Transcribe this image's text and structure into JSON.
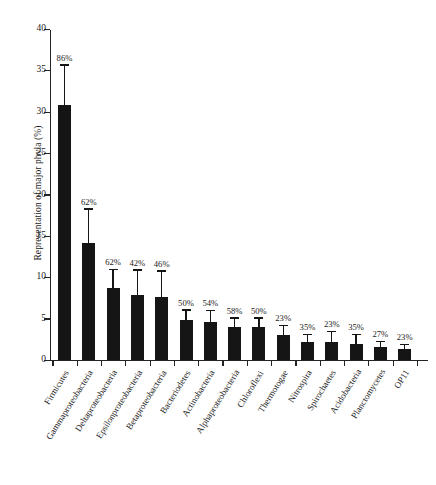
{
  "chart_data": {
    "type": "bar",
    "title": "",
    "xlabel": "",
    "ylabel": "Representation of major phyla (%)",
    "ylim": [
      0,
      40
    ],
    "ytick_labels": [
      "0",
      "5",
      "10",
      "15",
      "20",
      "25",
      "30",
      "35",
      "40"
    ],
    "ytick_values": [
      0,
      5,
      10,
      15,
      20,
      25,
      30,
      35,
      40
    ],
    "grid": false,
    "legend": "none",
    "categories": [
      "Firmicutes",
      "Gammaproteobacteria",
      "Deltaproteobacteria",
      "Epsilonproteobacteria",
      "Betaproteobacteria",
      "Bacteriodetes",
      "Actinobacteria",
      "Alphaproteobacteria",
      "Chloroflexi",
      "Thermotogae",
      "Nitrospira",
      "Spirochaetes",
      "Acidobacteria",
      "Planctomycetes",
      "OP11"
    ],
    "values": [
      30.8,
      14.1,
      8.7,
      7.8,
      7.6,
      4.8,
      4.6,
      4.0,
      4.0,
      3.0,
      2.2,
      2.2,
      1.9,
      1.6,
      1.3
    ],
    "errors": [
      4.9,
      4.2,
      2.3,
      3.1,
      3.2,
      1.3,
      1.4,
      1.1,
      1.1,
      1.2,
      0.9,
      1.3,
      1.2,
      0.7,
      0.6
    ],
    "point_labels": [
      "86%",
      "62%",
      "62%",
      "42%",
      "46%",
      "50%",
      "54%",
      "58%",
      "50%",
      "23%",
      "35%",
      "23%",
      "35%",
      "27%",
      "23%"
    ],
    "bar_color": "#151515",
    "axis_color": "#232323",
    "background_color": "#ffffff"
  }
}
